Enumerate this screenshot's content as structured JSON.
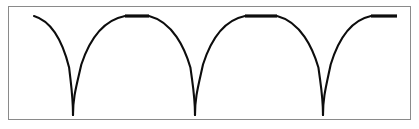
{
  "figure": {
    "title": "",
    "frame": {
      "border_color": "#8a8a8a",
      "background_color": "#ffffff",
      "has_border": true
    },
    "curve_color": "#0d0d0d",
    "caption": ""
  },
  "chart_data": {
    "type": "line",
    "title": "",
    "subtitle": "",
    "xlabel": "",
    "ylabel": "",
    "xlim": [
      0,
      403
    ],
    "ylim": [
      0,
      114
    ],
    "grid": false,
    "legend": "none",
    "axis_visible": false,
    "tick_labels_x": [],
    "tick_labels_y": [],
    "annotations": [],
    "description": "Three deep V-shaped notches separated by flat plateau segments at the top level; curve falls steeply to near-zero at each notch.",
    "series": [
      {
        "name": "response",
        "notch_count": 3,
        "plateau_count": 3,
        "top_level_y": 9,
        "notch_bottom_y": 108,
        "notch_x_positions": [
          64,
          186,
          314
        ],
        "plateau_segments": [
          {
            "x_start": 116,
            "x_end": 140,
            "y": 9
          },
          {
            "x_start": 236,
            "x_end": 268,
            "y": 9
          },
          {
            "x_start": 362,
            "x_end": 388,
            "y": 9
          }
        ],
        "curve_start_x": 25,
        "curve_end_x": 403,
        "x": [
          25,
          34,
          44,
          54,
          60,
          64,
          68,
          74,
          84,
          96,
          108,
          116,
          140,
          150,
          162,
          174,
          182,
          186,
          190,
          198,
          210,
          224,
          236,
          268,
          278,
          290,
          302,
          310,
          314,
          318,
          326,
          338,
          350,
          362,
          388,
          403
        ],
        "y": [
          9,
          16,
          28,
          52,
          78,
          108,
          78,
          52,
          28,
          16,
          11,
          9,
          9,
          11,
          18,
          38,
          72,
          108,
          72,
          38,
          18,
          11,
          9,
          9,
          11,
          18,
          40,
          74,
          108,
          74,
          40,
          18,
          11,
          9,
          9,
          9
        ]
      }
    ]
  }
}
